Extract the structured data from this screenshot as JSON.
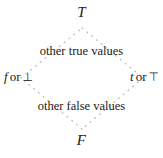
{
  "figure": {
    "name": "four-valued-truth-lattice",
    "dot_color": "#b0b0b0",
    "text_color": "#1a1a1a",
    "background": "#ffffff"
  },
  "vertices": {
    "top": "T",
    "bottom": "F",
    "left": {
      "var": "f",
      "conjunction": "or",
      "symbol": "⊥"
    },
    "right": {
      "var": "t",
      "conjunction": "or",
      "symbol": "⊤"
    }
  },
  "regions": {
    "upper": "other true values",
    "lower": "other false values"
  },
  "geometry": {
    "top_x": 82,
    "top_y": 28,
    "right_x": 143,
    "right_y": 78,
    "bottom_x": 82,
    "bottom_y": 129,
    "left_x": 21,
    "left_y": 78
  }
}
